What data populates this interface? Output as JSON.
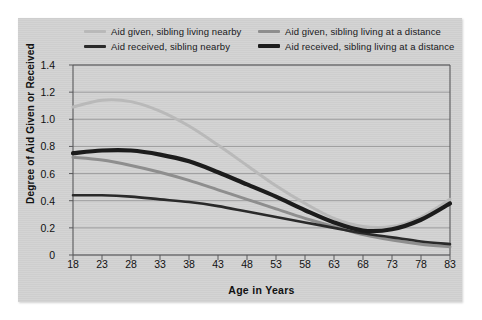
{
  "chart_data": {
    "type": "line",
    "title": "",
    "xlabel": "Age in Years",
    "ylabel": "Degree of Aid Given or Received",
    "xlim": [
      18,
      83
    ],
    "ylim": [
      0,
      1.4
    ],
    "grid": true,
    "legend_position": "top",
    "xticks": [
      18,
      23,
      28,
      33,
      38,
      43,
      48,
      53,
      58,
      63,
      68,
      73,
      78,
      83
    ],
    "yticks": [
      "0",
      "0.2",
      "0.4",
      "0.6",
      "0.8",
      "1.0",
      "1.2",
      "1.4"
    ],
    "x": [
      18,
      23,
      28,
      33,
      38,
      43,
      48,
      53,
      58,
      63,
      68,
      73,
      78,
      83
    ],
    "series": [
      {
        "name": "Aid given, sibling living nearby",
        "color": "#b9b9b9",
        "width": 3.0,
        "values": [
          1.09,
          1.14,
          1.13,
          1.06,
          0.95,
          0.81,
          0.66,
          0.51,
          0.38,
          0.27,
          0.21,
          0.21,
          0.28,
          0.41
        ]
      },
      {
        "name": "Aid given, sibling living at a distance",
        "color": "#8e8e8e",
        "width": 3.0,
        "values": [
          0.72,
          0.7,
          0.66,
          0.61,
          0.55,
          0.48,
          0.41,
          0.34,
          0.27,
          0.21,
          0.15,
          0.11,
          0.08,
          0.06
        ]
      },
      {
        "name": "Aid received, sibling nearby",
        "color": "#2a2a2a",
        "width": 2.6,
        "values": [
          0.44,
          0.44,
          0.43,
          0.41,
          0.39,
          0.36,
          0.32,
          0.28,
          0.24,
          0.2,
          0.16,
          0.13,
          0.1,
          0.08
        ]
      },
      {
        "name": "Aid received, sibling living at a distance",
        "color": "#1c1c1c",
        "width": 4.2,
        "values": [
          0.75,
          0.77,
          0.77,
          0.74,
          0.69,
          0.61,
          0.52,
          0.43,
          0.33,
          0.24,
          0.18,
          0.19,
          0.26,
          0.38
        ]
      }
    ]
  },
  "legend": {
    "entries": [
      {
        "label": "Aid given, sibling living nearby"
      },
      {
        "label": "Aid given, sibling living at a distance"
      },
      {
        "label": "Aid received, sibling nearby"
      },
      {
        "label": "Aid received, sibling living at a distance"
      }
    ]
  },
  "colors": {
    "panel_background": "#d2d2d2",
    "page_background": "#ffffff",
    "axis": "#58585a",
    "gridline": "#8d8d8f",
    "text": "#111111"
  }
}
